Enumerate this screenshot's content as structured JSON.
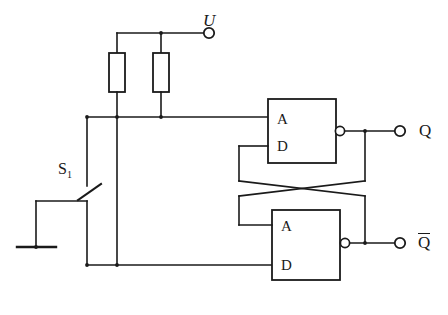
{
  "figure": {
    "type": "circuit-schematic",
    "stroke_color": "#1a1a1a",
    "background_color": "#ffffff"
  },
  "terminals": {
    "supply": {
      "label": "U",
      "name": "supply-terminal-u"
    },
    "output_q": {
      "label": "Q",
      "name": "output-terminal-q"
    },
    "output_qbar": {
      "label": "Q",
      "overline": true,
      "name": "output-terminal-qbar"
    }
  },
  "switch": {
    "label": "S",
    "subscript": "1",
    "name": "switch-s1",
    "state": "open"
  },
  "ground": {
    "name": "ground-symbol"
  },
  "resistors": [
    {
      "name": "resistor-r1",
      "label": ""
    },
    {
      "name": "resistor-r2",
      "label": ""
    }
  ],
  "gates": [
    {
      "name": "gate-top",
      "inputs": [
        "A",
        "D"
      ],
      "inverting_output": true,
      "output_terminal": "Q"
    },
    {
      "name": "gate-bottom",
      "inputs": [
        "A",
        "D"
      ],
      "inverting_output": true,
      "output_terminal": "Q"
    }
  ],
  "pin_labels": {
    "top_a": "A",
    "top_d": "D",
    "bottom_a": "A",
    "bottom_d": "D"
  }
}
